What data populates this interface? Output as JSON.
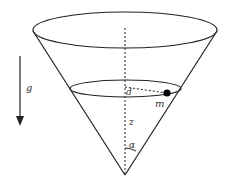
{
  "diagram": {
    "labels": {
      "gravity": "g",
      "distance": "d",
      "mass": "m",
      "height": "z",
      "angle": "α"
    },
    "colors": {
      "stroke": "#222222",
      "mass": "#000000",
      "text": "#333333"
    }
  }
}
